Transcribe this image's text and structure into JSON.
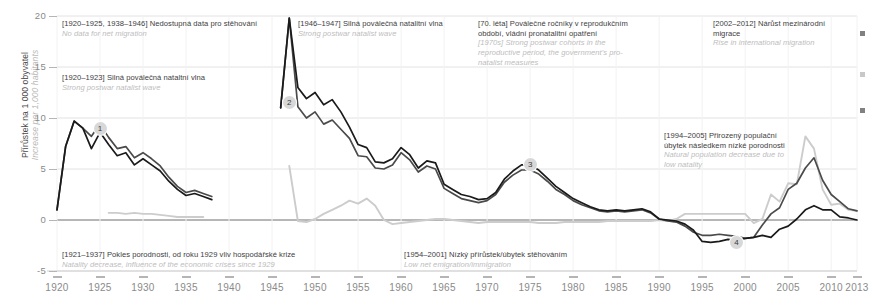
{
  "chart_data": {
    "type": "line",
    "title": "",
    "xlabel": "",
    "ylabel": "Přírůstek na 1 000 obyvatel",
    "ylabel_en": "Increase per 1,000 habitants",
    "xlim": [
      1920,
      2013
    ],
    "ylim": [
      -5,
      20
    ],
    "ytick_labels": [
      "20",
      "15",
      "10",
      "5",
      "0",
      "-5"
    ],
    "ytick_values": [
      20,
      15,
      10,
      5,
      0,
      -5
    ],
    "xtick_labels": [
      "1920",
      "1925",
      "1930",
      "1935",
      "1940",
      "1945",
      "1950",
      "1955",
      "1960",
      "1965",
      "1970",
      "1975",
      "1980",
      "1985",
      "1990",
      "1995",
      "2000",
      "2005",
      "2010",
      "2013"
    ],
    "xtick_values": [
      1920,
      1925,
      1930,
      1935,
      1940,
      1945,
      1950,
      1955,
      1960,
      1965,
      1970,
      1975,
      1980,
      1985,
      1990,
      1995,
      2000,
      2005,
      2010,
      2013
    ],
    "grid": true,
    "legend_position": "none",
    "series": [
      {
        "name": "Celkový přírůstek",
        "color": "#4a4a4a",
        "x": [
          1920,
          1921,
          1922,
          1923,
          1924,
          1925,
          1926,
          1927,
          1928,
          1929,
          1930,
          1931,
          1932,
          1933,
          1934,
          1935,
          1936,
          1937,
          1938,
          1946,
          1947,
          1948,
          1949,
          1950,
          1951,
          1952,
          1953,
          1954,
          1955,
          1956,
          1957,
          1958,
          1959,
          1960,
          1961,
          1962,
          1963,
          1964,
          1965,
          1966,
          1967,
          1968,
          1969,
          1970,
          1971,
          1972,
          1973,
          1974,
          1975,
          1976,
          1977,
          1978,
          1979,
          1980,
          1981,
          1982,
          1983,
          1984,
          1985,
          1986,
          1987,
          1988,
          1989,
          1990,
          1991,
          1992,
          1993,
          1994,
          1995,
          1996,
          1997,
          1998,
          1999,
          2000,
          2001,
          2002,
          2003,
          2004,
          2005,
          2006,
          2007,
          2008,
          2009,
          2010,
          2011,
          2012,
          2013
        ],
        "y": [
          1.0,
          7.2,
          9.7,
          9.0,
          8.2,
          9.4,
          8.1,
          7.0,
          7.2,
          6.1,
          6.6,
          6.0,
          5.3,
          4.2,
          3.3,
          2.7,
          2.9,
          2.6,
          2.3,
          11.0,
          19.8,
          11.1,
          10.0,
          10.6,
          9.4,
          9.8,
          8.9,
          8.0,
          6.3,
          6.2,
          5.1,
          5.0,
          5.4,
          6.6,
          5.9,
          4.7,
          5.3,
          5.0,
          3.1,
          2.6,
          2.1,
          1.9,
          1.7,
          1.9,
          2.5,
          3.7,
          4.4,
          4.9,
          4.9,
          4.5,
          3.8,
          3.0,
          2.5,
          1.9,
          1.5,
          1.2,
          0.9,
          0.8,
          0.9,
          0.8,
          0.9,
          1.0,
          0.7,
          0.1,
          -0.1,
          -0.2,
          -0.6,
          -1.2,
          -1.5,
          -1.5,
          -1.4,
          -1.5,
          -1.6,
          -1.8,
          -1.7,
          -0.5,
          0.6,
          1.2,
          3.0,
          3.6,
          5.1,
          6.1,
          3.9,
          2.5,
          1.8,
          1.1,
          0.9
        ]
      },
      {
        "name": "Přirozený přírůstek",
        "color": "#1a1a1a",
        "x": [
          1920,
          1921,
          1922,
          1923,
          1924,
          1925,
          1926,
          1927,
          1928,
          1929,
          1930,
          1931,
          1932,
          1933,
          1934,
          1935,
          1936,
          1937,
          1938,
          1946,
          1947,
          1948,
          1949,
          1950,
          1951,
          1952,
          1953,
          1954,
          1955,
          1956,
          1957,
          1958,
          1959,
          1960,
          1961,
          1962,
          1963,
          1964,
          1965,
          1966,
          1967,
          1968,
          1969,
          1970,
          1971,
          1972,
          1973,
          1974,
          1975,
          1976,
          1977,
          1978,
          1979,
          1980,
          1981,
          1982,
          1983,
          1984,
          1985,
          1986,
          1987,
          1988,
          1989,
          1990,
          1991,
          1992,
          1993,
          1994,
          1995,
          1996,
          1997,
          1998,
          1999,
          2000,
          2001,
          2002,
          2003,
          2004,
          2005,
          2006,
          2007,
          2008,
          2009,
          2010,
          2011,
          2012,
          2013
        ],
        "y": [
          1.0,
          7.2,
          9.7,
          9.0,
          7.0,
          8.6,
          7.4,
          6.3,
          6.6,
          5.4,
          6.0,
          5.4,
          4.8,
          3.8,
          3.0,
          2.4,
          2.6,
          2.3,
          2.0,
          11.0,
          19.8,
          13.0,
          11.9,
          12.5,
          11.3,
          11.8,
          10.6,
          9.1,
          7.4,
          7.1,
          5.7,
          5.6,
          6.0,
          7.1,
          6.4,
          5.1,
          5.8,
          5.6,
          3.5,
          3.0,
          2.5,
          2.3,
          2.0,
          2.1,
          2.7,
          4.0,
          4.8,
          5.4,
          5.4,
          4.9,
          4.1,
          3.3,
          2.7,
          2.1,
          1.7,
          1.3,
          1.0,
          0.9,
          1.0,
          0.9,
          1.0,
          1.1,
          0.8,
          0.1,
          0.0,
          -0.1,
          -0.4,
          -1.0,
          -2.1,
          -2.2,
          -2.1,
          -1.9,
          -2.0,
          -1.8,
          -1.7,
          -1.5,
          -1.7,
          -0.9,
          -0.6,
          0.1,
          1.0,
          1.4,
          1.0,
          1.0,
          0.3,
          0.2,
          0.0
        ]
      },
      {
        "name": "Přírůstek stěhováním",
        "color": "#cccccc",
        "x": [
          1926,
          1927,
          1928,
          1929,
          1930,
          1931,
          1932,
          1933,
          1934,
          1935,
          1936,
          1937,
          1947,
          1948,
          1949,
          1950,
          1951,
          1952,
          1953,
          1954,
          1955,
          1956,
          1957,
          1958,
          1959,
          1960,
          1961,
          1962,
          1963,
          1964,
          1965,
          1966,
          1967,
          1968,
          1969,
          1970,
          1971,
          1972,
          1973,
          1974,
          1975,
          1976,
          1977,
          1978,
          1979,
          1980,
          1981,
          1982,
          1983,
          1984,
          1985,
          1986,
          1987,
          1988,
          1989,
          1990,
          1991,
          1992,
          1993,
          1994,
          1995,
          1996,
          1997,
          1998,
          1999,
          2000,
          2001,
          2002,
          2003,
          2004,
          2005,
          2006,
          2007,
          2008,
          2009,
          2010,
          2011,
          2012,
          2013
        ],
        "y": [
          0.7,
          0.7,
          0.6,
          0.7,
          0.6,
          0.6,
          0.5,
          0.4,
          0.3,
          0.3,
          0.3,
          0.3,
          5.3,
          -0.1,
          -0.2,
          0.1,
          0.6,
          1.0,
          1.4,
          1.9,
          1.6,
          2.1,
          1.4,
          0.0,
          -0.4,
          -0.3,
          -0.2,
          -0.1,
          0.0,
          0.1,
          0.1,
          0.0,
          -0.1,
          -0.2,
          -0.3,
          -0.2,
          -0.2,
          -0.2,
          -0.2,
          -0.2,
          -0.2,
          -0.3,
          -0.3,
          -0.3,
          -0.2,
          -0.2,
          -0.2,
          -0.2,
          -0.2,
          -0.1,
          -0.1,
          -0.1,
          -0.1,
          -0.1,
          -0.1,
          0.0,
          -0.1,
          0.1,
          0.6,
          0.6,
          0.6,
          0.6,
          0.6,
          0.6,
          0.6,
          0.6,
          -0.3,
          0.1,
          2.5,
          1.8,
          3.6,
          3.5,
          8.2,
          7.0,
          3.0,
          1.5,
          1.6,
          1.0,
          0.9
        ]
      }
    ],
    "markers": [
      {
        "id": "1",
        "label": "1",
        "x": 1925,
        "y": 9.0
      },
      {
        "id": "2",
        "label": "2",
        "x": 1947,
        "y": 11.5
      },
      {
        "id": "3",
        "label": "3",
        "x": 1975,
        "y": 5.4
      },
      {
        "id": "4",
        "label": "4",
        "x": 1999,
        "y": -2.2
      }
    ],
    "annotations": [
      {
        "id": "no-data-migration",
        "cz": "[1920–1925, 1938–1946] Nedostupná data pro stěhování",
        "en": "No data for net migration"
      },
      {
        "id": "postwar-natalist-1920",
        "cz": "[1920–1923] Silná poválečná nataltní vlna",
        "en": "Strong postwar natalist wave"
      },
      {
        "id": "postwar-natalist-1946",
        "cz": "[1946–1947] Silná poválečná natalitní vlna",
        "en": "Strong postwar natalist wave"
      },
      {
        "id": "seventies-cohorts",
        "cz": "[70. léta] Poválečné ročníky v reprodukčním období, vládní pronatalitní opatření",
        "en": "[1970s] Strong postwar cohorts in the reproductive period, the government's pro-natalist measures"
      },
      {
        "id": "international-migration",
        "cz": "[2002–2012] Nárůst mezinárodní migrace",
        "en": "Rise in international migration"
      },
      {
        "id": "natural-decrease",
        "cz": "[1994–2005] Přirozený populační úbytek následkem nízké porodnosti",
        "en": "Natural population decrease due to low natality"
      },
      {
        "id": "natality-decrease",
        "cz": "[1921–1937] Pokles porodnosti, od roku 1929 vliv hospodářské krize",
        "en": "Natality decrease, influence of the economic crises since 1929"
      },
      {
        "id": "low-net-migration",
        "cz": "[1954–2001] Nízký přírůstek/úbytek stěhováním",
        "en": "Low net emigration/immigration"
      }
    ],
    "colors": {
      "natural_increase": "#1a1a1a",
      "total_increase": "#4a4a4a",
      "net_migration": "#cccccc",
      "grid": "#e2e2e2",
      "axis_text": "#8a8a8a"
    }
  }
}
